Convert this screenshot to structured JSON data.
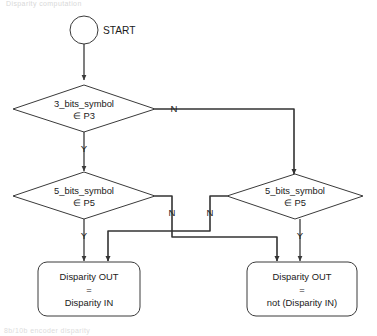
{
  "diagram": {
    "type": "flowchart",
    "title_fragment_top": "Disparity computation",
    "title_fragment_bottom": "8b/10b encoder disparity",
    "colors": {
      "stroke": "#3a3a3a",
      "connector": "#333333",
      "fill": "#ffffff",
      "text": "#1a1a1a"
    },
    "nodes": {
      "start": {
        "id": "start",
        "shape": "circle",
        "label": "START"
      },
      "decision_p3": {
        "id": "decision_p3",
        "shape": "diamond",
        "line1": "3_bits_symbol",
        "line2": "∈ P3"
      },
      "decision_p5_left": {
        "id": "decision_p5_left",
        "shape": "diamond",
        "line1": "5_bits_symbol",
        "line2": "∈ P5"
      },
      "decision_p5_right": {
        "id": "decision_p5_right",
        "shape": "diamond",
        "line1": "5_bits_symbol",
        "line2": "∈ P5"
      },
      "result_same": {
        "id": "result_same",
        "shape": "rounded-rect",
        "line1": "Disparity OUT",
        "line2": "=",
        "line3": "Disparity IN"
      },
      "result_inverted": {
        "id": "result_inverted",
        "shape": "rounded-rect",
        "line1": "Disparity OUT",
        "line2": "=",
        "line3": "not (Disparity IN)"
      }
    },
    "branch_labels": {
      "p3_no": "N",
      "p3_yes": "Y",
      "p5_left_no": "N",
      "p5_left_yes": "Y",
      "p5_right_no": "N",
      "p5_right_yes": "Y"
    }
  }
}
